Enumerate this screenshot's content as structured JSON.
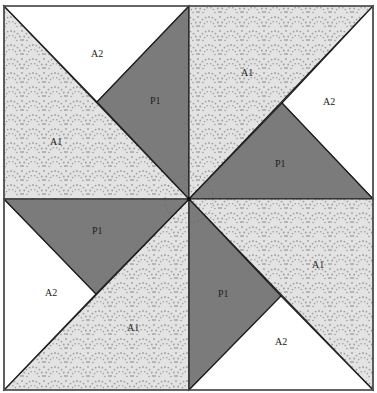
{
  "diagram": {
    "type": "quilt-block-pinwheel",
    "colors": {
      "background": "#ffffff",
      "p1_fill": "#7b7b7b",
      "a1_fill": "#e3e3e3",
      "a1_dots": "#9e9e9e",
      "a2_fill": "#ffffff",
      "stroke": "#1e1e1e",
      "frame": "#555555"
    },
    "quadrants": [
      {
        "name": "top-left",
        "pieces": [
          {
            "id": "A2",
            "label": "A2",
            "fabric": "white"
          },
          {
            "id": "P1",
            "label": "P1",
            "fabric": "gray"
          },
          {
            "id": "A1",
            "label": "A1",
            "fabric": "patterned"
          }
        ]
      },
      {
        "name": "top-right",
        "pieces": [
          {
            "id": "A1",
            "label": "A1",
            "fabric": "patterned"
          },
          {
            "id": "A2",
            "label": "A2",
            "fabric": "white"
          },
          {
            "id": "P1",
            "label": "P1",
            "fabric": "gray"
          }
        ]
      },
      {
        "name": "bottom-left",
        "pieces": [
          {
            "id": "P1",
            "label": "P1",
            "fabric": "gray"
          },
          {
            "id": "A2",
            "label": "A2",
            "fabric": "white"
          },
          {
            "id": "A1",
            "label": "A1",
            "fabric": "patterned"
          }
        ]
      },
      {
        "name": "bottom-right",
        "pieces": [
          {
            "id": "A1",
            "label": "A1",
            "fabric": "patterned"
          },
          {
            "id": "P1",
            "label": "P1",
            "fabric": "gray"
          },
          {
            "id": "A2",
            "label": "A2",
            "fabric": "white"
          }
        ]
      }
    ]
  }
}
